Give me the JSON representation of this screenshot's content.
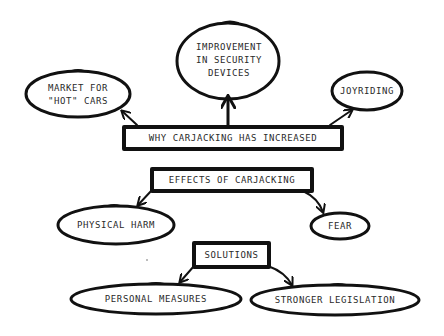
{
  "diagram": {
    "type": "concept-map",
    "colors": {
      "stroke": "#111111",
      "text": "#2a2a2a",
      "background": "#ffffff"
    },
    "nodes": {
      "why_increased": {
        "label": "Why carjacking has increased",
        "shape": "rectangle"
      },
      "improvement": {
        "label": "Improvement\nin security\ndevices",
        "shape": "ellipse"
      },
      "market": {
        "label": "Market for\n\"hot\" cars",
        "shape": "ellipse"
      },
      "joyriding": {
        "label": "Joyriding",
        "shape": "ellipse"
      },
      "effects": {
        "label": "Effects of carjacking",
        "shape": "rectangle"
      },
      "physical_harm": {
        "label": "Physical harm",
        "shape": "ellipse"
      },
      "fear": {
        "label": "Fear",
        "shape": "ellipse"
      },
      "solutions": {
        "label": "Solutions",
        "shape": "rectangle"
      },
      "personal_measures": {
        "label": "Personal measures",
        "shape": "ellipse"
      },
      "stronger_legislation": {
        "label": "Stronger legislation",
        "shape": "ellipse"
      }
    },
    "edges": [
      {
        "from": "why_increased",
        "to": "improvement"
      },
      {
        "from": "why_increased",
        "to": "market"
      },
      {
        "from": "why_increased",
        "to": "joyriding"
      },
      {
        "from": "effects",
        "to": "physical_harm"
      },
      {
        "from": "effects",
        "to": "fear"
      },
      {
        "from": "solutions",
        "to": "personal_measures"
      },
      {
        "from": "solutions",
        "to": "stronger_legislation"
      }
    ]
  }
}
